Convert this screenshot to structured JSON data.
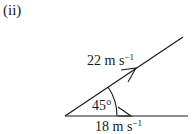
{
  "part_label": "(ii)",
  "vectors": [
    {
      "name": "upper",
      "magnitude_label": "22 m s",
      "unit_exponent": "−1"
    },
    {
      "name": "horizontal",
      "magnitude_label": "18 m s",
      "unit_exponent": "−1"
    }
  ],
  "angle_label": "45°",
  "colors": {
    "ink": "#1a1a1a",
    "background": "#ffffff"
  }
}
